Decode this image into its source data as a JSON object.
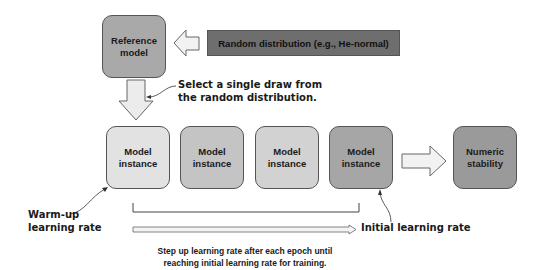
{
  "diagram": {
    "reference_model": {
      "label": "Reference model",
      "line1": "Reference",
      "line2": "model",
      "color": "#a9a9a9"
    },
    "random_distribution": {
      "label": "Random distribution (e.g., He-normal)",
      "color": "#6e6e6e"
    },
    "select_note": {
      "line1": "Select a single draw from",
      "line2": "the random distribution."
    },
    "model_instances": [
      {
        "line1": "Model",
        "line2": "instance",
        "color": "#e2e2e2"
      },
      {
        "line1": "Model",
        "line2": "instance",
        "color": "#c4c4c4"
      },
      {
        "line1": "Model",
        "line2": "instance",
        "color": "#d2d2d2"
      },
      {
        "line1": "Model",
        "line2": "instance",
        "color": "#a6a6a6"
      }
    ],
    "numeric_stability": {
      "line1": "Numeric",
      "line2": "stability",
      "color": "#9a9a9a"
    },
    "warmup_note": {
      "line1": "Warm-up",
      "line2": "learning rate"
    },
    "initial_note": {
      "label": "Initial learning rate"
    },
    "step_caption": {
      "line1": "Step up learning rate after each epoch until",
      "line2": "reaching initial learning rate for training."
    }
  }
}
